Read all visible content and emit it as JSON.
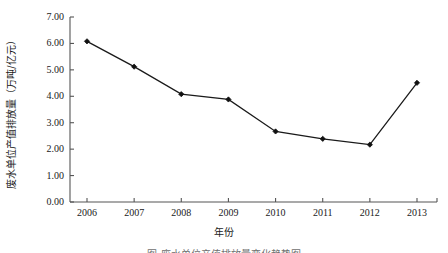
{
  "chart_data": {
    "type": "line",
    "title": "",
    "xlabel": "年份",
    "ylabel": "废水单位产值排放量（万吨/亿元）",
    "categories": [
      "2006",
      "2007",
      "2008",
      "2009",
      "2010",
      "2011",
      "2012",
      "2013"
    ],
    "values": [
      6.08,
      5.12,
      4.08,
      3.88,
      2.67,
      2.39,
      2.17,
      4.51
    ],
    "series": [
      {
        "name": "废水单位产值排放量",
        "values": [
          6.08,
          5.12,
          4.08,
          3.88,
          2.67,
          2.39,
          2.17,
          4.51
        ]
      }
    ],
    "ylim": [
      0.0,
      7.0
    ],
    "ytick_labels": [
      "0.00",
      "1.00",
      "2.00",
      "3.00",
      "4.00",
      "5.00",
      "6.00",
      "7.00"
    ],
    "ytick_values": [
      0,
      1,
      2,
      3,
      4,
      5,
      6,
      7
    ],
    "xtick_labels": [
      "2006",
      "2007",
      "2008",
      "2009",
      "2010",
      "2011",
      "2012",
      "2013"
    ],
    "grid": false,
    "legend": "none",
    "line_color": "#1a1a1a",
    "marker": "diamond",
    "marker_color": "#111111",
    "axis_color": "#555555",
    "background": "#ffffff"
  },
  "caption": {
    "text": "图  废水单位产值排放量变化趋势图"
  }
}
